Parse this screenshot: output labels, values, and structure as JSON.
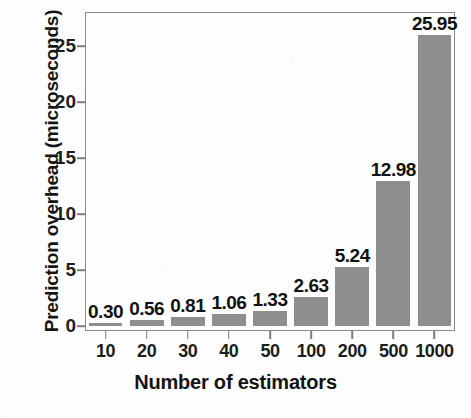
{
  "chart_data": {
    "type": "bar",
    "title": "",
    "xlabel": "Number of estimators",
    "ylabel": "Prediction overhead (microseconds)",
    "categories": [
      "10",
      "20",
      "30",
      "40",
      "50",
      "100",
      "200",
      "500",
      "1000"
    ],
    "values": [
      0.3,
      0.56,
      0.81,
      1.06,
      1.33,
      2.63,
      5.24,
      12.98,
      25.95
    ],
    "data_labels": [
      "0.30",
      "0.56",
      "0.81",
      "1.06",
      "1.33",
      "2.63",
      "5.24",
      "12.98",
      "25.95"
    ],
    "ylim": [
      0,
      27.5
    ],
    "yticks": [
      0,
      5,
      10,
      15,
      20,
      25
    ],
    "ytick_labels": [
      "0",
      "5",
      "10",
      "15",
      "20",
      "25"
    ],
    "grid": false,
    "legend": null,
    "bar_color": "#8e8e8e",
    "axis_color": "#8a8a8a",
    "text_color": "#1d1d1d",
    "background_color": "#fdfdfd"
  }
}
